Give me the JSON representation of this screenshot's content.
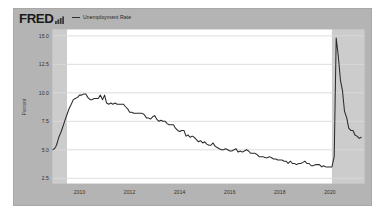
{
  "widget": {
    "brand": "FRED",
    "brand_icon": "bar-chart-icon",
    "background_color": "#b4b4b4",
    "plot_background_color": "#ffffff"
  },
  "legend": {
    "position": "top-left",
    "entries": [
      {
        "label": "Unemployment Rate",
        "color": "#2b2b2b",
        "marker": "line"
      }
    ]
  },
  "chart_data": {
    "type": "line",
    "title": "",
    "subtitle": "",
    "xlabel": "",
    "ylabel": "Percent",
    "xlim": [
      2008.9,
      2021.4
    ],
    "ylim": [
      2.0,
      15.6
    ],
    "grid": true,
    "legend_position": "top-left",
    "x_tick_labels": [
      "2010",
      "2012",
      "2014",
      "2016",
      "2018",
      "2020"
    ],
    "x_ticks": [
      2010,
      2012,
      2014,
      2016,
      2018,
      2020
    ],
    "y_tick_labels": [
      "15.0",
      "12.5",
      "10.0",
      "7.5",
      "5.0",
      "2.5"
    ],
    "y_ticks": [
      15.0,
      12.5,
      10.0,
      7.5,
      5.0,
      2.5
    ],
    "series": [
      {
        "name": "Unemployment Rate",
        "color": "#2b2b2b",
        "units": "Percent",
        "x": [
          2008.92,
          2009.0,
          2009.08,
          2009.17,
          2009.25,
          2009.33,
          2009.42,
          2009.5,
          2009.58,
          2009.67,
          2009.75,
          2009.83,
          2009.92,
          2010.0,
          2010.08,
          2010.17,
          2010.25,
          2010.33,
          2010.42,
          2010.5,
          2010.58,
          2010.67,
          2010.75,
          2010.83,
          2010.92,
          2011.0,
          2011.08,
          2011.17,
          2011.25,
          2011.33,
          2011.42,
          2011.5,
          2011.58,
          2011.67,
          2011.75,
          2011.83,
          2011.92,
          2012.0,
          2012.08,
          2012.17,
          2012.25,
          2012.33,
          2012.42,
          2012.5,
          2012.58,
          2012.67,
          2012.75,
          2012.83,
          2012.92,
          2013.0,
          2013.08,
          2013.17,
          2013.25,
          2013.33,
          2013.42,
          2013.5,
          2013.58,
          2013.67,
          2013.75,
          2013.83,
          2013.92,
          2014.0,
          2014.08,
          2014.17,
          2014.25,
          2014.33,
          2014.42,
          2014.5,
          2014.58,
          2014.67,
          2014.75,
          2014.83,
          2014.92,
          2015.0,
          2015.08,
          2015.17,
          2015.25,
          2015.33,
          2015.42,
          2015.5,
          2015.58,
          2015.67,
          2015.75,
          2015.83,
          2015.92,
          2016.0,
          2016.08,
          2016.17,
          2016.25,
          2016.33,
          2016.42,
          2016.5,
          2016.58,
          2016.67,
          2016.75,
          2016.83,
          2016.92,
          2017.0,
          2017.08,
          2017.17,
          2017.25,
          2017.33,
          2017.42,
          2017.5,
          2017.58,
          2017.67,
          2017.75,
          2017.83,
          2017.92,
          2018.0,
          2018.08,
          2018.17,
          2018.25,
          2018.33,
          2018.42,
          2018.5,
          2018.58,
          2018.67,
          2018.75,
          2018.83,
          2018.92,
          2019.0,
          2019.08,
          2019.17,
          2019.25,
          2019.33,
          2019.42,
          2019.5,
          2019.58,
          2019.67,
          2019.75,
          2019.83,
          2019.92,
          2020.0,
          2020.08,
          2020.17,
          2020.25,
          2020.33,
          2020.42,
          2020.5,
          2020.58,
          2020.67,
          2020.75,
          2020.83,
          2020.92,
          2021.0,
          2021.08,
          2021.17,
          2021.25
        ],
        "y": [
          5.0,
          5.1,
          5.4,
          6.1,
          6.5,
          7.0,
          7.6,
          8.1,
          8.6,
          9.0,
          9.4,
          9.5,
          9.6,
          9.8,
          9.8,
          9.9,
          9.9,
          9.6,
          9.4,
          9.4,
          9.5,
          9.5,
          9.5,
          9.8,
          9.4,
          9.8,
          9.1,
          9.0,
          9.1,
          9.0,
          9.1,
          9.0,
          9.0,
          9.0,
          9.0,
          8.8,
          8.6,
          8.3,
          8.3,
          8.2,
          8.2,
          8.2,
          8.2,
          8.2,
          8.1,
          7.8,
          7.8,
          7.7,
          7.9,
          8.0,
          7.7,
          7.5,
          7.6,
          7.5,
          7.5,
          7.3,
          7.2,
          7.2,
          7.2,
          6.9,
          6.7,
          6.6,
          6.7,
          6.7,
          6.2,
          6.3,
          6.1,
          6.2,
          6.1,
          5.9,
          5.7,
          5.8,
          5.6,
          5.7,
          5.5,
          5.4,
          5.4,
          5.6,
          5.3,
          5.2,
          5.1,
          5.0,
          5.0,
          5.1,
          5.0,
          4.9,
          4.9,
          5.0,
          5.1,
          4.8,
          4.9,
          4.8,
          4.9,
          5.0,
          4.9,
          4.7,
          4.7,
          4.7,
          4.6,
          4.4,
          4.4,
          4.4,
          4.3,
          4.3,
          4.4,
          4.3,
          4.2,
          4.2,
          4.1,
          4.1,
          4.1,
          4.0,
          4.0,
          3.8,
          4.0,
          3.8,
          3.8,
          3.7,
          3.8,
          3.8,
          3.9,
          4.0,
          3.8,
          3.8,
          3.6,
          3.6,
          3.7,
          3.7,
          3.7,
          3.5,
          3.6,
          3.5,
          3.5,
          3.5,
          3.5,
          4.4,
          14.8,
          13.3,
          11.1,
          10.2,
          8.4,
          7.8,
          6.9,
          6.7,
          6.7,
          6.3,
          6.2,
          6.0,
          6.1
        ]
      }
    ],
    "recession_bands": [
      {
        "start": 2008.9,
        "end": 2009.5,
        "color": "#c3c3c3"
      },
      {
        "start": 2020.08,
        "end": 2021.4,
        "color": "#c3c3c3"
      }
    ],
    "annotations": []
  }
}
